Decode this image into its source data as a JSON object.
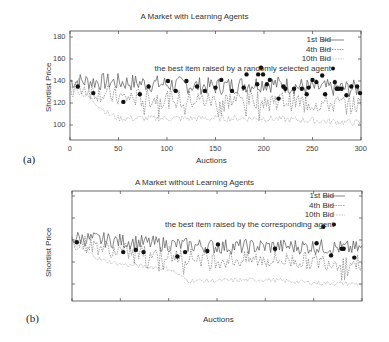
{
  "chart_data": [
    {
      "type": "line",
      "panel_label": "(a)",
      "title": "A Market with Learning Agents",
      "xlabel": "Auctions",
      "ylabel": "Shortlist Price",
      "xlim": [
        0,
        300
      ],
      "ylim": [
        85,
        185
      ],
      "xticks": [
        "0",
        "50",
        "100",
        "150",
        "200",
        "250",
        "300"
      ],
      "yticks": [
        "100",
        "120",
        "140",
        "160",
        "180"
      ],
      "grid": false,
      "legend_position": "top-right",
      "series": [
        {
          "name": "1st Bid",
          "style": "solid",
          "trend": {
            "x": [
              0,
              50,
              100,
              150,
              200,
              250,
              300
            ],
            "y": [
              140,
              139,
              137,
              135,
              138,
              134,
              133
            ]
          },
          "amplitude": 8
        },
        {
          "name": "4th Bid",
          "style": "dashed",
          "trend": {
            "x": [
              0,
              50,
              100,
              150,
              200,
              250,
              300
            ],
            "y": [
              137,
              125,
              124,
              122,
              124,
              120,
              118
            ]
          },
          "amplitude": 9
        },
        {
          "name": "10th Bid",
          "style": "dotted",
          "trend": {
            "x": [
              0,
              20,
              40,
              50,
              100,
              150,
              200,
              250,
              300
            ],
            "y": [
              135,
              125,
              110,
              106,
              106,
              106,
              106,
              104,
              102
            ]
          },
          "amplitude": 3
        },
        {
          "name": "the best item raised by a randomly selected agent",
          "style": "points",
          "points": [
            [
              8,
              135
            ],
            [
              24,
              129
            ],
            [
              55,
              121
            ],
            [
              72,
              128
            ],
            [
              81,
              135
            ],
            [
              101,
              140
            ],
            [
              109,
              131
            ],
            [
              120,
              140
            ],
            [
              131,
              135
            ],
            [
              139,
              131
            ],
            [
              150,
              134
            ],
            [
              156,
              141
            ],
            [
              167,
              131
            ],
            [
              179,
              134
            ],
            [
              182,
              146
            ],
            [
              193,
              137
            ],
            [
              194,
              146
            ],
            [
              197,
              152
            ],
            [
              199,
              146
            ],
            [
              203,
              137
            ],
            [
              206,
              141
            ],
            [
              215,
              124
            ],
            [
              220,
              135
            ],
            [
              222,
              133
            ],
            [
              231,
              133
            ],
            [
              239,
              133
            ],
            [
              244,
              128
            ],
            [
              246,
              134
            ],
            [
              250,
              141
            ],
            [
              254,
              139
            ],
            [
              260,
              145
            ],
            [
              263,
              128
            ],
            [
              273,
              139
            ],
            [
              275,
              133
            ],
            [
              277,
              133
            ],
            [
              280,
              133
            ],
            [
              285,
              127
            ],
            [
              290,
              135
            ],
            [
              296,
              135
            ],
            [
              299,
              129
            ]
          ]
        }
      ]
    },
    {
      "type": "line",
      "panel_label": "(b)",
      "title": "A Market without Learning Agents",
      "xlabel": "Auctions",
      "ylabel": "Shortlist Price",
      "xlim": [
        0,
        300
      ],
      "ylim": [
        85,
        185
      ],
      "xticks": [
        "0",
        "50",
        "100",
        "150",
        "200",
        "250",
        "300"
      ],
      "yticks": [
        "100",
        "120",
        "140",
        "160",
        "180"
      ],
      "grid": false,
      "legend_position": "top-right",
      "series": [
        {
          "name": "1st Bid",
          "style": "solid",
          "trend": {
            "x": [
              0,
              50,
              100,
              150,
              200,
              250,
              300
            ],
            "y": [
              142,
              139,
              136,
              134,
              134,
              134,
              132
            ]
          },
          "amplitude": 7
        },
        {
          "name": "4th Bid",
          "style": "dashed",
          "trend": {
            "x": [
              0,
              50,
              100,
              150,
              200,
              250,
              300
            ],
            "y": [
              139,
              130,
              127,
              122,
              122,
              121,
              119
            ]
          },
          "amplitude": 8
        },
        {
          "name": "10th Bid",
          "style": "dotted",
          "trend": {
            "x": [
              0,
              30,
              50,
              100,
              120,
              150,
              200,
              250,
              300
            ],
            "y": [
              137,
              122,
              118,
              114,
              103,
              103,
              104,
              101,
              100
            ]
          },
          "amplitude": 2
        },
        {
          "name": "the best item raised by the corresponding agent",
          "style": "points",
          "points": [
            [
              5,
              138
            ],
            [
              53,
              129
            ],
            [
              66,
              131
            ],
            [
              74,
              129
            ],
            [
              109,
              125
            ],
            [
              117,
              129
            ],
            [
              140,
              130
            ],
            [
              151,
              136
            ],
            [
              210,
              132
            ],
            [
              253,
              137
            ],
            [
              260,
              152
            ],
            [
              268,
              126
            ],
            [
              279,
              132
            ],
            [
              281,
              132
            ],
            [
              292,
              124
            ]
          ]
        }
      ]
    }
  ]
}
